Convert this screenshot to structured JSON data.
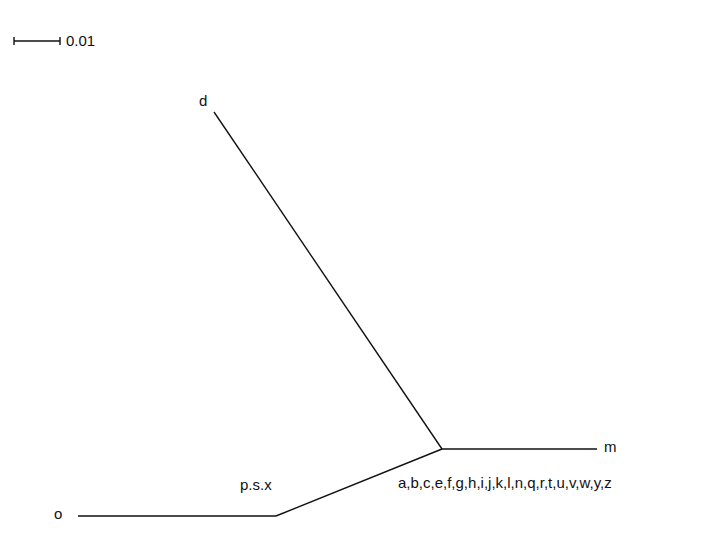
{
  "diagram": {
    "type": "phylogenetic-tree",
    "scale_bar": {
      "label": "0.01"
    },
    "leaves": {
      "d": "d",
      "m": "m",
      "o": "o",
      "group_psx": "p.s.x",
      "group_rest": "a,b,c,e,f,g,h,i,j,k,l,n,q,r,t,u,v,w,y,z"
    },
    "colors": {
      "line": "#111111",
      "background": "#ffffff"
    }
  }
}
